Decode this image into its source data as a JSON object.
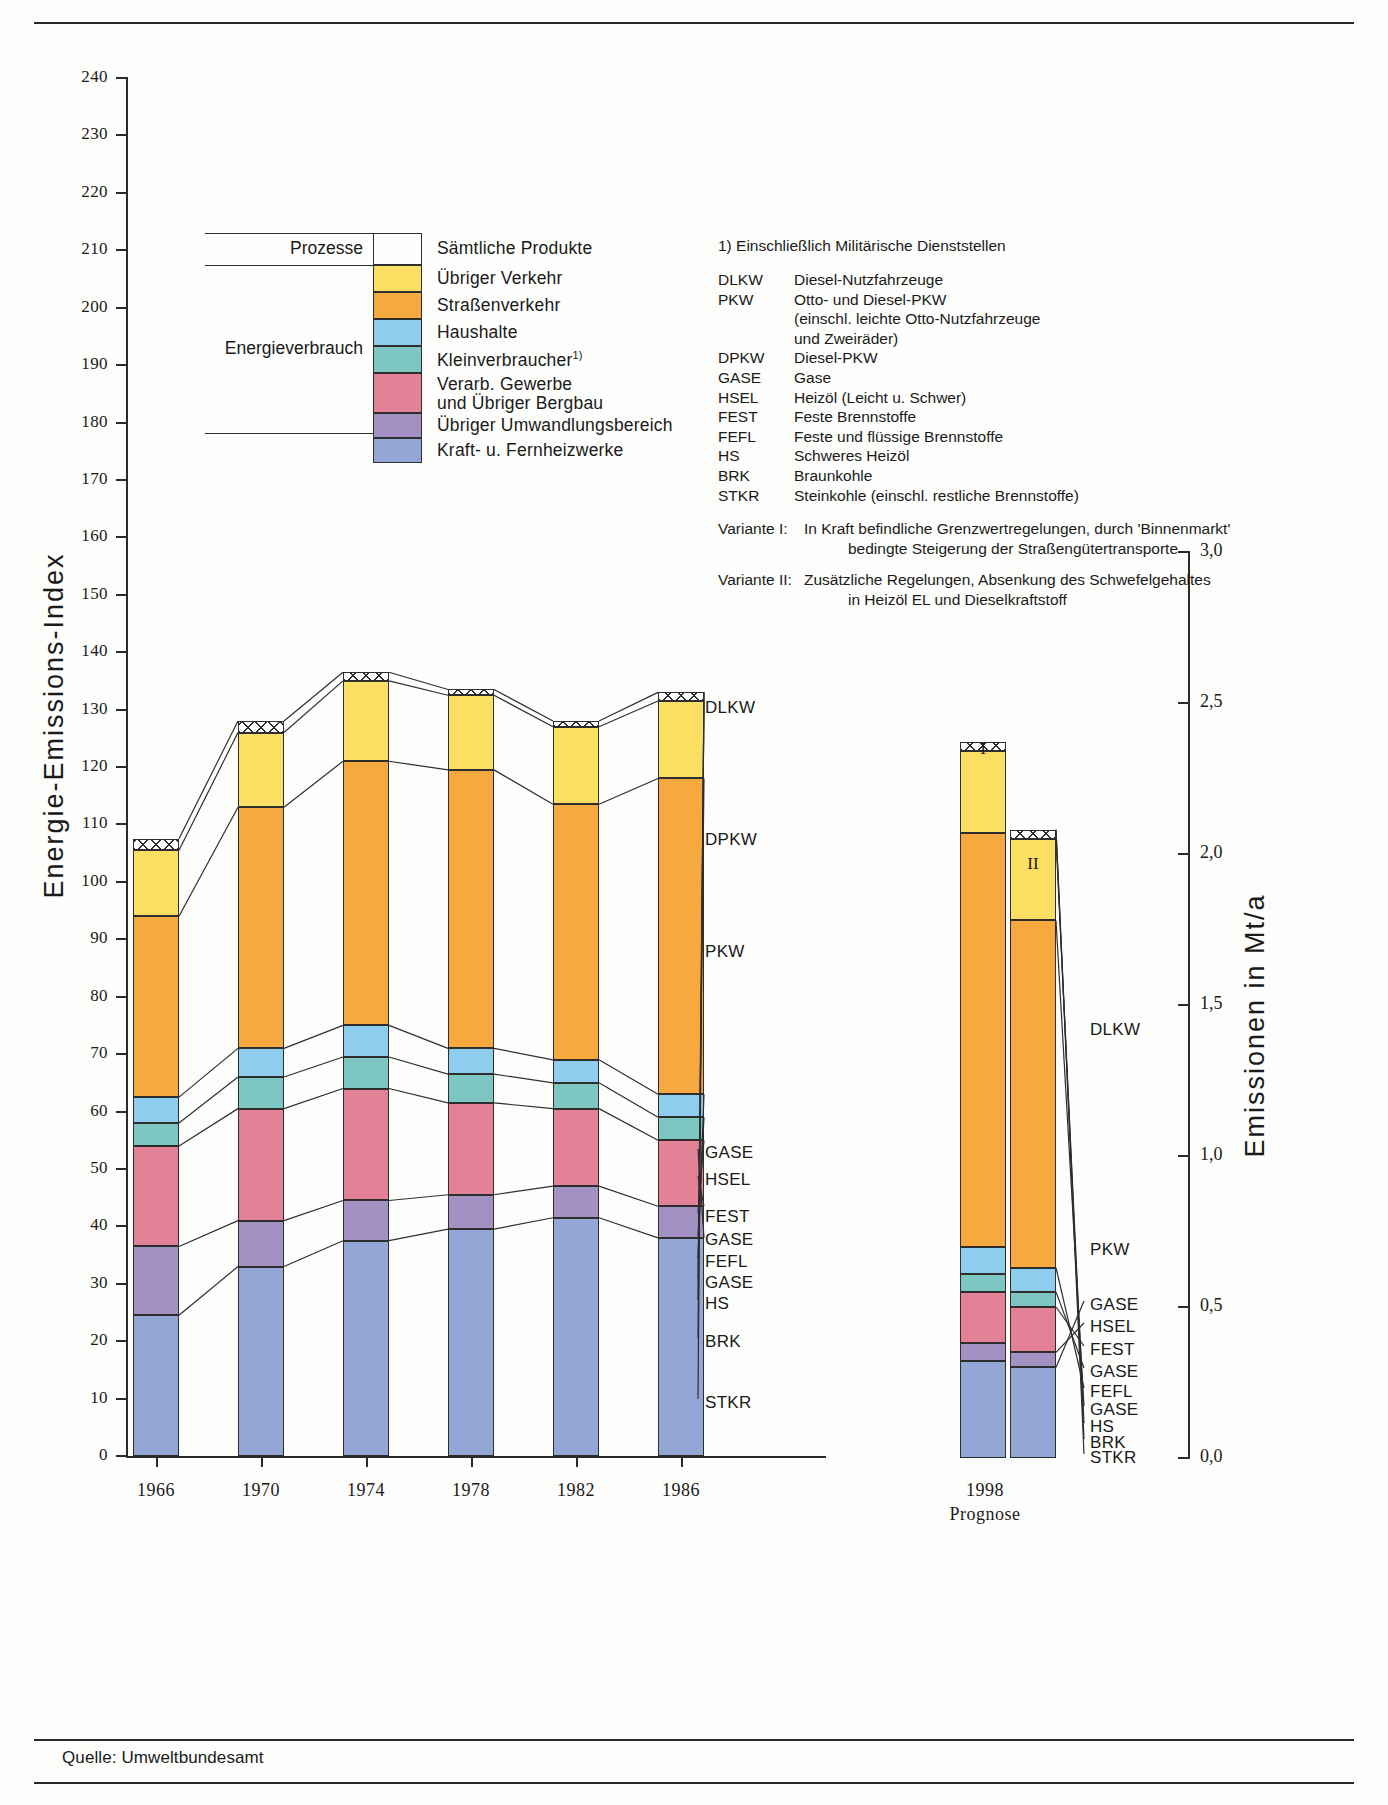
{
  "source_note": "Quelle: Umweltbundesamt",
  "axes": {
    "left_title": "Energie-Emissions-Index",
    "right_title": "Emissionen in Mt/a",
    "left_ticks": [
      240,
      230,
      220,
      210,
      200,
      190,
      180,
      170,
      160,
      150,
      140,
      130,
      120,
      110,
      100,
      90,
      80,
      70,
      60,
      50,
      40,
      30,
      20,
      10,
      0
    ],
    "right_ticks": [
      "3,0",
      "2,5",
      "2,0",
      "1,5",
      "1,0",
      "0,5",
      "0,0"
    ],
    "right_tick_values": [
      3.0,
      2.5,
      2.0,
      1.5,
      1.0,
      0.5,
      0.0
    ],
    "x_categories": [
      "1966",
      "1970",
      "1974",
      "1978",
      "1982",
      "1986"
    ],
    "forecast_label": "1998",
    "forecast_sublabel": "Prognose",
    "variant_labels": [
      "I",
      "II"
    ]
  },
  "legend": {
    "group_labels": [
      "Prozesse",
      "Energieverbrauch"
    ],
    "items": [
      {
        "key": "saemtliche-produkte",
        "label": "Sämtliche Produkte",
        "color": "#ffffff",
        "pattern": "crosshatch"
      },
      {
        "key": "uebriger-verkehr",
        "label": "Übriger Verkehr",
        "color": "#fbdf63"
      },
      {
        "key": "strassenverkehr",
        "label": "Straßenverkehr",
        "color": "#f5a93f"
      },
      {
        "key": "haushalte",
        "label": "Haushalte",
        "color": "#8fcdee"
      },
      {
        "key": "kleinverbraucher",
        "label": "Kleinverbraucher",
        "sup": "1)",
        "color": "#7dc6c2"
      },
      {
        "key": "verarb-gewerbe",
        "label": "Verarb. Gewerbe",
        "label2": "und Übriger Bergbau",
        "color": "#e38196"
      },
      {
        "key": "uebriger-umwandlungsbereich",
        "label": "Übriger Umwandlungsbereich",
        "color": "#a391c4"
      },
      {
        "key": "kraft-fernheizwerke",
        "label": "Kraft- u. Fernheizwerke",
        "color": "#93a6d6"
      }
    ]
  },
  "notes": {
    "footnote": "1)  Einschließlich Militärische Dienststellen",
    "abbreviations": [
      {
        "k": "DLKW",
        "v": "Diesel-Nutzfahrzeuge"
      },
      {
        "k": "PKW",
        "v": "Otto- und Diesel-PKW"
      },
      {
        "k": "",
        "v": "(einschl. leichte Otto-Nutzfahrzeuge"
      },
      {
        "k": "",
        "v": "und Zweiräder)"
      },
      {
        "k": "DPKW",
        "v": "Diesel-PKW"
      },
      {
        "k": "GASE",
        "v": "Gase"
      },
      {
        "k": "HSEL",
        "v": "Heizöl (Leicht u. Schwer)"
      },
      {
        "k": "FEST",
        "v": "Feste Brennstoffe"
      },
      {
        "k": "FEFL",
        "v": "Feste und flüssige Brennstoffe"
      },
      {
        "k": "HS",
        "v": "Schweres Heizöl"
      },
      {
        "k": "BRK",
        "v": "Braunkohle"
      },
      {
        "k": "STKR",
        "v": "Steinkohle (einschl. restliche Brennstoffe)"
      }
    ],
    "variants": [
      {
        "k": "Variante I:",
        "l1": "In Kraft befindliche Grenzwertregelungen, durch 'Binnenmarkt'",
        "l2": "bedingte Steigerung der Straßengütertransporte"
      },
      {
        "k": "Variante II:",
        "l1": "Zusätzliche Regelungen, Absenkung des Schwefelgehaltes",
        "l2": "in Heizöl EL und Dieselkraftstoff"
      }
    ]
  },
  "callouts_main": [
    {
      "label": "DLKW",
      "y": 708
    },
    {
      "label": "DPKW",
      "y": 840
    },
    {
      "label": "PKW",
      "y": 952
    },
    {
      "label": "GASE",
      "y": 1153
    },
    {
      "label": "HSEL",
      "y": 1180
    },
    {
      "label": "FEST",
      "y": 1217
    },
    {
      "label": "GASE",
      "y": 1240
    },
    {
      "label": "FEFL",
      "y": 1262
    },
    {
      "label": "GASE",
      "y": 1283
    },
    {
      "label": "HS",
      "y": 1304
    },
    {
      "label": "BRK",
      "y": 1342
    },
    {
      "label": "STKR",
      "y": 1403
    }
  ],
  "callouts_forecast": [
    {
      "label": "DLKW",
      "y": 1030
    },
    {
      "label": "PKW",
      "y": 1250
    },
    {
      "label": "GASE",
      "y": 1305
    },
    {
      "label": "HSEL",
      "y": 1327
    },
    {
      "label": "FEST",
      "y": 1350
    },
    {
      "label": "GASE",
      "y": 1372
    },
    {
      "label": "FEFL",
      "y": 1392
    },
    {
      "label": "GASE",
      "y": 1410
    },
    {
      "label": "HS",
      "y": 1427
    },
    {
      "label": "BRK",
      "y": 1443
    },
    {
      "label": "STKR",
      "y": 1458
    }
  ],
  "chart_data": {
    "type": "bar",
    "title": "Energie-Emissions-Index",
    "xlabel": "",
    "ylabel": "Energie-Emissions-Index",
    "ylabel_right": "Emissionen in Mt/a",
    "ylim": [
      0,
      240
    ],
    "ylim_right": [
      0.0,
      3.0
    ],
    "grid": false,
    "stacked": true,
    "categories": [
      "1966",
      "1970",
      "1974",
      "1978",
      "1982",
      "1986",
      "1998 I",
      "1998 II"
    ],
    "series_order_bottom_to_top": [
      "Kraft- u. Fernheizwerke",
      "Übriger Umwandlungsbereich",
      "Verarb. Gewerbe und Übriger Bergbau",
      "Kleinverbraucher",
      "Haushalte",
      "Straßenverkehr",
      "Übriger Verkehr",
      "Sämtliche Produkte"
    ],
    "series": [
      {
        "name": "Kraft- u. Fernheizwerke",
        "color": "#93a6d6",
        "values": [
          24.5,
          33.0,
          37.5,
          39.5,
          41.5,
          38.0,
          0.32,
          0.3
        ]
      },
      {
        "name": "Übriger Umwandlungsbereich",
        "color": "#a391c4",
        "values": [
          12.0,
          8.0,
          7.0,
          6.0,
          5.5,
          5.5,
          0.06,
          0.05
        ]
      },
      {
        "name": "Verarb. Gewerbe und Übriger Bergbau",
        "color": "#e38196",
        "values": [
          17.5,
          19.5,
          19.5,
          16.0,
          13.5,
          11.5,
          0.17,
          0.15
        ]
      },
      {
        "name": "Kleinverbraucher",
        "color": "#7dc6c2",
        "values": [
          4.0,
          5.5,
          5.5,
          5.0,
          4.5,
          4.0,
          0.06,
          0.05
        ]
      },
      {
        "name": "Haushalte",
        "color": "#8fcdee",
        "values": [
          4.5,
          5.0,
          5.5,
          4.5,
          4.0,
          4.0,
          0.09,
          0.08
        ]
      },
      {
        "name": "Straßenverkehr",
        "color": "#f5a93f",
        "values": [
          31.5,
          42.0,
          46.0,
          48.5,
          44.5,
          55.0,
          1.37,
          1.15
        ]
      },
      {
        "name": "Übriger Verkehr",
        "color": "#fbdf63",
        "values": [
          11.5,
          13.0,
          14.0,
          13.0,
          13.5,
          13.5,
          0.27,
          0.27
        ]
      },
      {
        "name": "Sämtliche Produkte",
        "color": "#ffffff",
        "pattern": "crosshatch",
        "values": [
          2.0,
          2.0,
          1.5,
          1.0,
          1.0,
          1.5,
          0.03,
          0.03
        ]
      }
    ],
    "category_totals": [
      102.0,
      124.0,
      135.0,
      149.0,
      148.0,
      156.0,
      2.28,
      1.9
    ],
    "annotation_labels_main": [
      "DLKW",
      "DPKW",
      "PKW",
      "GASE",
      "HSEL",
      "FEST",
      "GASE",
      "FEFL",
      "GASE",
      "HS",
      "BRK",
      "STKR"
    ],
    "annotation_labels_forecast": [
      "DLKW",
      "PKW",
      "GASE",
      "HSEL",
      "FEST",
      "GASE",
      "FEFL",
      "GASE",
      "HS",
      "BRK",
      "STKR"
    ]
  }
}
